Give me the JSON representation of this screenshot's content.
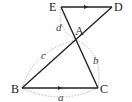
{
  "diagram": {
    "type": "geometry",
    "points": [
      {
        "id": "E",
        "label": "E",
        "x": 61,
        "y": 8
      },
      {
        "id": "D",
        "label": "D",
        "x": 112,
        "y": 8
      },
      {
        "id": "A",
        "label": "A",
        "x": 76,
        "y": 40
      },
      {
        "id": "B",
        "label": "B",
        "x": 22,
        "y": 88
      },
      {
        "id": "C",
        "label": "C",
        "x": 98,
        "y": 88
      }
    ],
    "segments": [
      {
        "from": "E",
        "to": "D",
        "arrow_mark": true
      },
      {
        "from": "E",
        "to": "C"
      },
      {
        "from": "D",
        "to": "B"
      },
      {
        "from": "B",
        "to": "C",
        "arrow_mark": true
      }
    ],
    "arc_labels": {
      "a": "a",
      "b": "b",
      "c": "c",
      "d": "d"
    },
    "colors": {
      "line": "#222222",
      "arc": "#b0b0b0"
    }
  }
}
